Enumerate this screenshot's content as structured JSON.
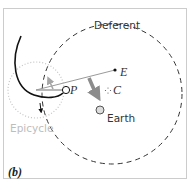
{
  "diagram": {
    "panel_label": "(b)",
    "labels": {
      "deferent": "Deferent",
      "epicycle": "Epicycle",
      "earth": "Earth",
      "planet": "P",
      "equant": "E",
      "center": "C"
    },
    "colors": {
      "frame": "#cccccc",
      "deferent": "#333333",
      "epicycle": "#bdbdbd",
      "retrograde_path": "#111111",
      "radius_line": "#999999",
      "motion_arrow": "#8c8c8c",
      "epicycle_arrow": "#a6a6a6",
      "earth_fill": "#dddddd"
    }
  }
}
